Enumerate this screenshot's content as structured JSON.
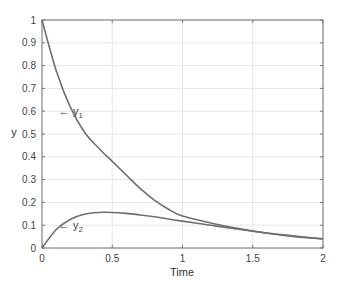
{
  "chart_data": {
    "type": "line",
    "title": "",
    "xlabel": "Time",
    "ylabel": "y",
    "xlim": [
      0,
      2
    ],
    "ylim": [
      0,
      1
    ],
    "grid": true,
    "legend": "none (inline annotations)",
    "xticks": [
      "0",
      "0.5",
      "1",
      "1.5",
      "2"
    ],
    "yticks": [
      "0",
      "0.1",
      "0.2",
      "0.3",
      "0.4",
      "0.5",
      "0.6",
      "0.7",
      "0.8",
      "0.9",
      "1"
    ],
    "x": [
      0,
      0.1,
      0.2,
      0.3,
      0.4,
      0.5,
      0.6,
      0.7,
      0.8,
      0.9,
      1.0,
      1.2,
      1.4,
      1.6,
      1.8,
      2.0
    ],
    "series": [
      {
        "name": "y1",
        "annotation": "← y1",
        "annotation_at": [
          0.12,
          0.6
        ],
        "color": "#6f6f6f",
        "values": [
          1.0,
          0.78,
          0.62,
          0.51,
          0.44,
          0.38,
          0.32,
          0.26,
          0.21,
          0.17,
          0.14,
          0.11,
          0.085,
          0.065,
          0.05,
          0.04
        ]
      },
      {
        "name": "y2",
        "annotation": "← y2",
        "annotation_at": [
          0.12,
          0.1
        ],
        "color": "#6f6f6f",
        "values": [
          0.0,
          0.08,
          0.125,
          0.148,
          0.156,
          0.156,
          0.152,
          0.145,
          0.137,
          0.127,
          0.118,
          0.1,
          0.082,
          0.066,
          0.052,
          0.04
        ]
      }
    ]
  }
}
